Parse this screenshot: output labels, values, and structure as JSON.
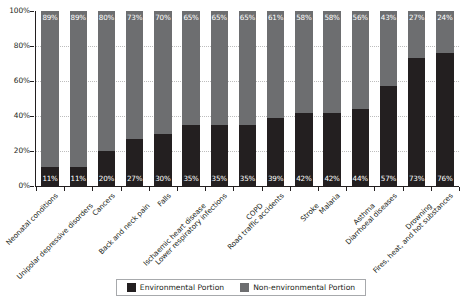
{
  "chart_data": {
    "type": "bar",
    "subtype": "stacked-bar-100-percent",
    "title": "",
    "subtitle": "",
    "xlabel": "",
    "ylabel": "",
    "ylim": [
      0,
      100
    ],
    "ytick_labels": [
      "0%",
      "20%",
      "40%",
      "60%",
      "80%",
      "100%"
    ],
    "ytick_values": [
      0,
      20,
      40,
      60,
      80,
      100
    ],
    "grid": true,
    "legend_position": "bottom",
    "categories": [
      "Neonatal conditions",
      "Unipolar depressive disorders",
      "Cancers",
      "Back and neck pain",
      "Falls",
      "Ischaemic heart disease",
      "Lower respiratory infections",
      "COPD",
      "Road traffic accidents",
      "Stroke",
      "Malaria",
      "Asthma",
      "Diarrhoeal diseases",
      "Drowning",
      "Fires, heat, and hot substances"
    ],
    "series": [
      {
        "name": "Environmental Portion",
        "color": "#231f20",
        "values": [
          11,
          11,
          20,
          27,
          30,
          35,
          35,
          35,
          39,
          42,
          42,
          44,
          57,
          73,
          76
        ],
        "labels": [
          "11%",
          "11%",
          "20%",
          "27%",
          "30%",
          "35%",
          "35%",
          "35%",
          "39%",
          "42%",
          "42%",
          "44%",
          "57%",
          "73%",
          "76%"
        ]
      },
      {
        "name": "Non-environmental Portion",
        "color": "#6d6e70",
        "values": [
          89,
          89,
          80,
          73,
          70,
          65,
          65,
          65,
          61,
          58,
          58,
          56,
          43,
          27,
          24
        ],
        "labels": [
          "89%",
          "89%",
          "80%",
          "73%",
          "70%",
          "65%",
          "65%",
          "65%",
          "61%",
          "58%",
          "58%",
          "56%",
          "43%",
          "27%",
          "24%"
        ]
      }
    ]
  },
  "legend": {
    "items": [
      {
        "label": "Environmental Portion",
        "swatch": "env"
      },
      {
        "label": "Non-environmental Portion",
        "swatch": "nonenv"
      }
    ]
  }
}
